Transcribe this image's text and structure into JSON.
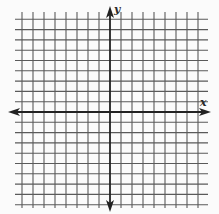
{
  "diagram": {
    "type": "coordinate-plane",
    "x_axis_label": "x",
    "y_axis_label": "y",
    "grid": {
      "vertical_lines_left_of_y_axis": 8,
      "vertical_lines_right_of_y_axis": 8,
      "horizontal_lines_above_x_axis": 9,
      "horizontal_lines_below_x_axis": 9,
      "x_spacing_px": 11,
      "y_spacing_px": 10.3
    },
    "arrows": {
      "x_axis": "both-ends",
      "y_axis": "both-ends"
    },
    "colors": {
      "background": "#fbfbfb",
      "grid_line": "#5a5a5a",
      "axis_line": "#222222"
    }
  }
}
